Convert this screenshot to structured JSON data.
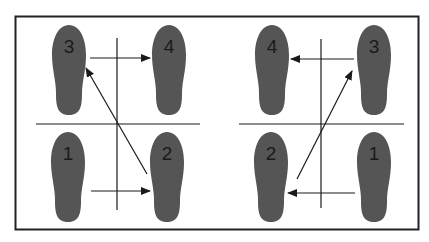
{
  "diagram": {
    "colors": {
      "foot": "#555555",
      "line": "#1a1a1a",
      "border": "#222222"
    },
    "left_panel": {
      "feet": [
        {
          "label": "3",
          "cx": 69,
          "top": 25
        },
        {
          "label": "4",
          "cx": 169,
          "top": 25
        },
        {
          "label": "1",
          "cx": 68,
          "top": 132
        },
        {
          "label": "2",
          "cx": 167,
          "top": 132
        }
      ]
    },
    "right_panel": {
      "feet": [
        {
          "label": "4",
          "cx": 272,
          "top": 25
        },
        {
          "label": "3",
          "cx": 374,
          "top": 25
        },
        {
          "label": "2",
          "cx": 271,
          "top": 132
        },
        {
          "label": "1",
          "cx": 374,
          "top": 132
        }
      ]
    }
  }
}
